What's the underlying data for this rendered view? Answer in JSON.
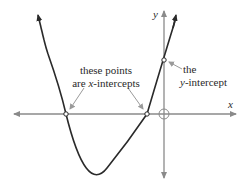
{
  "diagram": {
    "axes": {
      "x_label": "x",
      "y_label": "y",
      "axis_color": "#8a8a8a",
      "curve_color": "#2a2a2a"
    },
    "annotations": {
      "x_intercepts": {
        "line1": "these points",
        "line2_prefix": "are ",
        "line2_var": "x",
        "line2_suffix": "-intercepts"
      },
      "y_intercept": {
        "line1": "the",
        "line2_var": "y",
        "line2_suffix": "-intercept"
      }
    },
    "points": {
      "x_intercept_left": [
        66,
        114
      ],
      "x_intercept_right": [
        147,
        114
      ],
      "y_intercept": [
        164,
        60
      ],
      "origin": [
        164,
        114
      ]
    }
  }
}
